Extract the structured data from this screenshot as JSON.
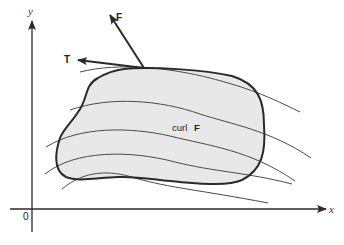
{
  "diagram": {
    "axes": {
      "x_label": "x",
      "y_label": "y",
      "origin_label": "0"
    },
    "vectors": {
      "field": {
        "label": "F"
      },
      "tangent": {
        "label": "T"
      }
    },
    "region": {
      "label_prefix": "curl",
      "label_vector": "F",
      "fill_color": "#e8e8e8",
      "stroke_color": "#2a2a2a"
    },
    "flow_curves_count": 5,
    "colors": {
      "ink": "#2a2a2a",
      "curve": "#4a4a4a",
      "background": "#ffffff"
    }
  }
}
